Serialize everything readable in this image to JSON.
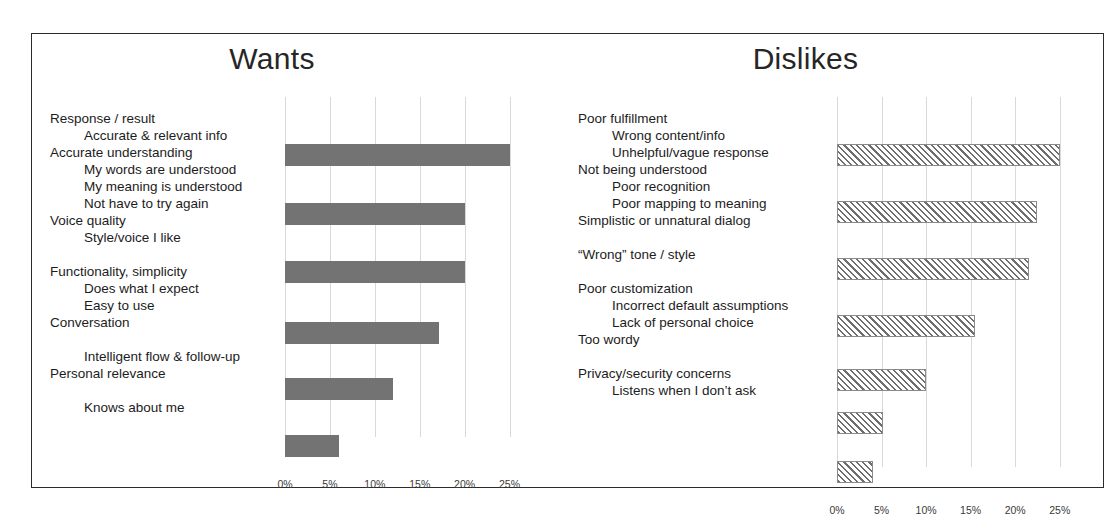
{
  "slide": {
    "panels": [
      {
        "key": "wants",
        "title": "Wants",
        "bar_style": "solid",
        "bar_color": "#737373",
        "label_blocks": [
          {
            "type": "main",
            "text": "Response / result"
          },
          {
            "type": "sub",
            "text": "Accurate & relevant info"
          },
          {
            "type": "main",
            "text": "Accurate understanding"
          },
          {
            "type": "sub",
            "text": "My words are understood"
          },
          {
            "type": "sub",
            "text": "My meaning is understood"
          },
          {
            "type": "sub",
            "text": "Not have to try again"
          },
          {
            "type": "main",
            "text": "Voice quality"
          },
          {
            "type": "sub",
            "text": "Style/voice I like"
          },
          {
            "type": "spacer",
            "text": ""
          },
          {
            "type": "main",
            "text": "Functionality, simplicity"
          },
          {
            "type": "sub",
            "text": "Does what I expect"
          },
          {
            "type": "sub",
            "text": "Easy to use"
          },
          {
            "type": "main",
            "text": "Conversation"
          },
          {
            "type": "spacer",
            "text": ""
          },
          {
            "type": "sub",
            "text": "Intelligent flow & follow-up"
          },
          {
            "type": "main",
            "text": "Personal relevance"
          },
          {
            "type": "spacer",
            "text": ""
          },
          {
            "type": "sub",
            "text": "Knows about me"
          }
        ]
      },
      {
        "key": "dislikes",
        "title": "Dislikes",
        "bar_style": "hatched",
        "bar_color": "#6e6e6e",
        "label_blocks": [
          {
            "type": "main",
            "text": "Poor fulfillment"
          },
          {
            "type": "sub",
            "text": "Wrong content/info"
          },
          {
            "type": "sub",
            "text": "Unhelpful/vague response"
          },
          {
            "type": "main",
            "text": "Not being understood"
          },
          {
            "type": "sub",
            "text": "Poor recognition"
          },
          {
            "type": "sub",
            "text": "Poor mapping to meaning"
          },
          {
            "type": "main",
            "text": "Simplistic or unnatural dialog"
          },
          {
            "type": "spacer",
            "text": ""
          },
          {
            "type": "main",
            "text": "“Wrong” tone / style"
          },
          {
            "type": "spacer",
            "text": ""
          },
          {
            "type": "main",
            "text": "Poor customization"
          },
          {
            "type": "sub",
            "text": "Incorrect default assumptions"
          },
          {
            "type": "sub",
            "text": "Lack of personal choice"
          },
          {
            "type": "main",
            "text": "Too wordy"
          },
          {
            "type": "spacer",
            "text": ""
          },
          {
            "type": "main",
            "text": "Privacy/security concerns"
          },
          {
            "type": "sub",
            "text": "Listens when I don’t ask"
          }
        ]
      }
    ]
  },
  "chart_data": [
    {
      "type": "bar",
      "orientation": "horizontal",
      "title": "Wants",
      "xlabel": "",
      "ylabel": "",
      "xlim": [
        0,
        27.5
      ],
      "grid": true,
      "ticks": [
        "0%",
        "5%",
        "10%",
        "15%",
        "20%",
        "25%"
      ],
      "tick_values": [
        0,
        5,
        10,
        15,
        20,
        25
      ],
      "legend": "none",
      "categories": [
        "Response / result",
        "Accurate understanding",
        "Voice quality",
        "Functionality, simplicity",
        "Conversation",
        "Personal relevance"
      ],
      "values": [
        25.0,
        20.0,
        20.0,
        17.2,
        12.0,
        6.0
      ]
    },
    {
      "type": "bar",
      "orientation": "horizontal",
      "title": "Dislikes",
      "xlabel": "",
      "ylabel": "",
      "xlim": [
        0,
        27.5
      ],
      "grid": true,
      "ticks": [
        "0%",
        "5%",
        "10%",
        "15%",
        "20%",
        "25%"
      ],
      "tick_values": [
        0,
        5,
        10,
        15,
        20,
        25
      ],
      "legend": "none",
      "categories": [
        "Poor fulfillment",
        "Not being understood",
        "Simplistic or unnatural dialog",
        "“Wrong” tone / style",
        "Poor customization",
        "Too wordy",
        "Privacy/security concerns"
      ],
      "values": [
        25.0,
        22.5,
        21.5,
        15.5,
        10.0,
        5.2,
        4.0
      ]
    }
  ]
}
